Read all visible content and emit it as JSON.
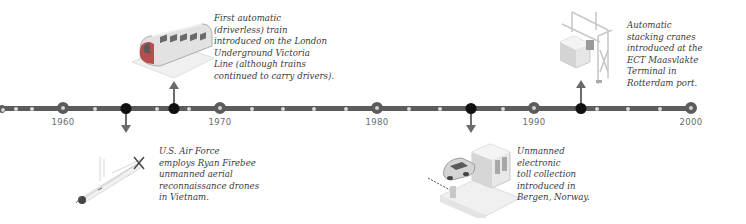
{
  "timeline": {
    "start_year": 1955,
    "end_year": 2000,
    "axis_color": "#5c5c5c",
    "event_marker_color": "#111111",
    "decade_labels": [
      {
        "year": "1960",
        "x": 63
      },
      {
        "year": "1970",
        "x": 220
      },
      {
        "year": "1980",
        "x": 377
      },
      {
        "year": "1990",
        "x": 534
      },
      {
        "year": "2000",
        "x": 691
      }
    ],
    "minor_dot_years": [
      1956,
      1958,
      1962,
      1966,
      1968,
      1972,
      1974,
      1976,
      1978,
      1982,
      1984,
      1988,
      1994,
      1996,
      1998
    ]
  },
  "events": [
    {
      "id": "firebee",
      "year": 1964,
      "direction": "down",
      "illustration": "drone-icon",
      "caption_lines": [
        "U.S. Air Force",
        "employs Ryan Firebee",
        "unmanned aerial",
        "reconnaissance drones",
        "in Vietnam."
      ]
    },
    {
      "id": "victoria-line",
      "year": 1967,
      "direction": "up",
      "illustration": "train-icon",
      "caption_lines": [
        "First automatic",
        "(driverless) train",
        "introduced on the London",
        "Underground Victoria",
        "Line (although trains",
        "continued to carry drivers)."
      ]
    },
    {
      "id": "bergen-toll",
      "year": 1986,
      "direction": "down",
      "illustration": "toll-booth-icon",
      "caption_lines": [
        "Unmanned",
        "electronic",
        "toll collection",
        "introduced in",
        "Bergen, Norway."
      ]
    },
    {
      "id": "ect-cranes",
      "year": 1993,
      "direction": "up",
      "illustration": "crane-icon",
      "caption_lines": [
        "Automatic",
        "stacking cranes",
        "introduced at the",
        "ECT Maasvlakte",
        "Terminal in",
        "Rotterdam port."
      ]
    }
  ]
}
